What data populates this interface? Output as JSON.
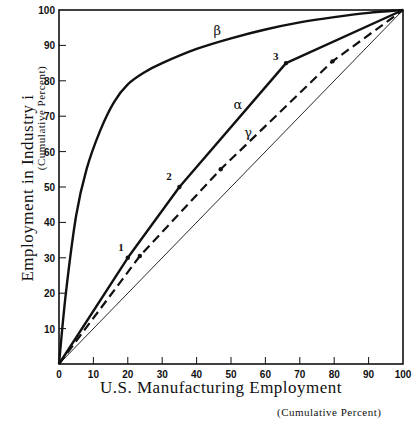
{
  "chart_data": {
    "type": "line",
    "title": "",
    "xlabel": "U.S. Manufacturing Employment",
    "xlabel_sub": "(Cumulative Percent)",
    "ylabel": "Employment in Industry i",
    "ylabel_sub": "(Cumulative Percent)",
    "xlim": [
      0,
      100
    ],
    "ylim": [
      0,
      100
    ],
    "x_ticks": [
      0,
      10,
      20,
      30,
      40,
      50,
      60,
      70,
      80,
      90,
      100
    ],
    "y_ticks": [
      10,
      20,
      30,
      40,
      50,
      60,
      70,
      80,
      90,
      100
    ],
    "grid": false,
    "legend": "inline labels",
    "series": [
      {
        "name": "α",
        "style": "solid-thick",
        "x": [
          0,
          20,
          35,
          66,
          100
        ],
        "y": [
          0,
          30,
          50,
          85,
          100
        ],
        "point_labels": [
          "",
          "1",
          "2",
          "3",
          ""
        ]
      },
      {
        "name": "β",
        "style": "solid-thick-curve",
        "x": [
          0,
          2,
          5,
          8,
          12,
          16,
          20,
          25,
          30,
          40,
          50,
          60,
          70,
          80,
          90,
          100
        ],
        "y": [
          0,
          20,
          42,
          55,
          66,
          74,
          79,
          82.5,
          85,
          89,
          92,
          94.5,
          96.5,
          98,
          99.2,
          100
        ]
      },
      {
        "name": "γ",
        "style": "dashed",
        "x": [
          0,
          23.5,
          47,
          79.5,
          100
        ],
        "y": [
          0,
          30.5,
          55,
          85.5,
          100
        ]
      },
      {
        "name": "equality line",
        "style": "solid-thin",
        "x": [
          0,
          100
        ],
        "y": [
          0,
          100
        ]
      }
    ],
    "annotations": [
      {
        "text": "β",
        "x": 46,
        "y": 93
      },
      {
        "text": "α",
        "x": 52,
        "y": 72
      },
      {
        "text": "γ",
        "x": 55,
        "y": 64
      },
      {
        "text": "1",
        "x": 18,
        "y": 32
      },
      {
        "text": "2",
        "x": 32,
        "y": 52
      },
      {
        "text": "3",
        "x": 63,
        "y": 86
      }
    ]
  },
  "labels": {
    "xlabel": "U.S.  Manufacturing  Employment",
    "xlabel_sub": "(Cumulative Percent)",
    "ylabel": "Employment  in  Industry  i",
    "ylabel_sub": "(Cumulative Percent)"
  },
  "colors": {
    "ink": "#111111",
    "background": "#ffffff"
  }
}
